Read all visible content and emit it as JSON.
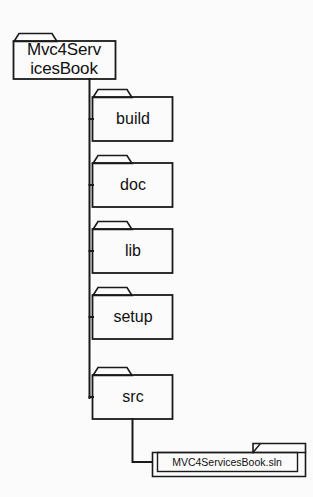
{
  "diagram": {
    "colors": {
      "background": "#fbfbfb",
      "line": "#1a1a1a",
      "node_fill": "#fdfdfd",
      "text": "#111111"
    },
    "root": {
      "type": "folder",
      "name": "Mvc4ServicesBook",
      "label_line1": "Mvc4Serv",
      "label_line2": "icesBook"
    },
    "children": [
      {
        "type": "folder",
        "name": "build",
        "label": "build"
      },
      {
        "type": "folder",
        "name": "doc",
        "label": "doc"
      },
      {
        "type": "folder",
        "name": "lib",
        "label": "lib"
      },
      {
        "type": "folder",
        "name": "setup",
        "label": "setup"
      },
      {
        "type": "folder",
        "name": "src",
        "label": "src"
      }
    ],
    "leaf_file": {
      "type": "file",
      "name": "MVC4ServicesBook.sln",
      "label": "MVC4ServicesBook.sln",
      "parent": "src"
    }
  }
}
